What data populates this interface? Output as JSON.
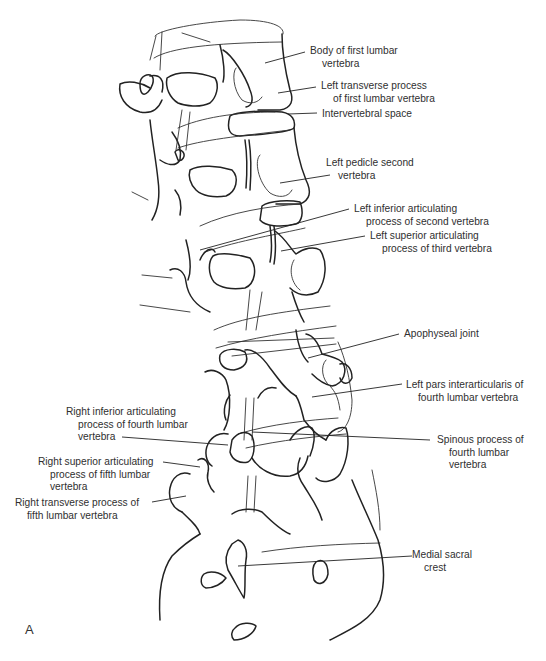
{
  "figure": {
    "panel_letter": "A",
    "labels": [
      {
        "id": "body-l1",
        "lines": [
          "Body of first lumbar",
          "vertebra"
        ],
        "x": 310,
        "y": 50,
        "indent": [
          0,
          12
        ]
      },
      {
        "id": "left-transverse-l1",
        "lines": [
          "Left transverse process",
          "of first lumbar vertebra"
        ],
        "x": 321,
        "y": 85,
        "indent": [
          0,
          12
        ]
      },
      {
        "id": "intervertebral-space",
        "lines": [
          "Intervertebral space"
        ],
        "x": 322,
        "y": 109,
        "indent": [
          0
        ]
      },
      {
        "id": "left-pedicle-second",
        "lines": [
          "Left pedicle second",
          "vertebra"
        ],
        "x": 326,
        "y": 157,
        "indent": [
          0,
          12
        ]
      },
      {
        "id": "left-inferior-articulating-second",
        "lines": [
          "Left inferior articulating",
          "process of second vertebra"
        ],
        "x": 354,
        "y": 204,
        "indent": [
          0,
          12
        ]
      },
      {
        "id": "left-superior-articulating-third",
        "lines": [
          "Left superior articulating",
          "process of third vertebra"
        ],
        "x": 370,
        "y": 231,
        "indent": [
          0,
          12
        ]
      },
      {
        "id": "apophyseal-joint",
        "lines": [
          "Apophyseal joint"
        ],
        "x": 404,
        "y": 327,
        "indent": [
          0
        ]
      },
      {
        "id": "left-pars-l4",
        "lines": [
          "Left pars interarticularis of",
          "fourth lumbar vertebra"
        ],
        "x": 406,
        "y": 379,
        "indent": [
          0,
          12
        ]
      },
      {
        "id": "spinous-l4",
        "lines": [
          "Spinous process of",
          "fourth lumbar",
          "vertebra"
        ],
        "x": 437,
        "y": 434,
        "indent": [
          0,
          12,
          12
        ]
      },
      {
        "id": "medial-sacral-crest",
        "lines": [
          "Medial sacral",
          "crest"
        ],
        "x": 411,
        "y": 549,
        "indent": [
          0,
          12
        ]
      },
      {
        "id": "right-inferior-articulating-l4",
        "lines": [
          "Right inferior articulating",
          "process of fourth lumbar",
          "vertebra"
        ],
        "x": 66,
        "y": 406,
        "indent": [
          0,
          12,
          12
        ]
      },
      {
        "id": "right-superior-articulating-l5",
        "lines": [
          "Right superior articulating",
          "process of fifth lumbar",
          "vertebra"
        ],
        "x": 38,
        "y": 456,
        "indent": [
          0,
          12,
          12
        ]
      },
      {
        "id": "right-transverse-l5",
        "lines": [
          "Right transverse process of",
          "fifth lumbar vertebra"
        ],
        "x": 15,
        "y": 497,
        "indent": [
          0,
          12
        ]
      }
    ],
    "leaders": [
      {
        "for": "body-l1",
        "x1": 305,
        "y1": 52,
        "x2": 265,
        "y2": 63
      },
      {
        "for": "left-transverse-l1",
        "x1": 316,
        "y1": 87,
        "x2": 278,
        "y2": 93
      },
      {
        "for": "intervertebral-space",
        "x1": 317,
        "y1": 113,
        "x2": 288,
        "y2": 114
      },
      {
        "for": "left-pedicle-second",
        "x1": 330,
        "y1": 175,
        "x2": 280,
        "y2": 183
      },
      {
        "for": "left-inferior-articulating-second",
        "x1": 349,
        "y1": 209,
        "x2": 200,
        "y2": 250
      },
      {
        "for": "left-superior-articulating-third",
        "x1": 365,
        "y1": 236,
        "x2": 281,
        "y2": 251
      },
      {
        "for": "apophyseal-joint",
        "x1": 399,
        "y1": 334,
        "x2": 308,
        "y2": 358
      },
      {
        "for": "left-pars-l4",
        "x1": 402,
        "y1": 384,
        "x2": 312,
        "y2": 397
      },
      {
        "for": "spinous-l4",
        "x1": 430,
        "y1": 440,
        "x2": 252,
        "y2": 432
      },
      {
        "for": "medial-sacral-crest",
        "x1": 412,
        "y1": 556,
        "x2": 238,
        "y2": 566
      },
      {
        "for": "right-inferior-articulating-l4",
        "x1": 122,
        "y1": 437,
        "x2": 228,
        "y2": 445
      },
      {
        "for": "right-superior-articulating-l5",
        "x1": 163,
        "y1": 462,
        "x2": 200,
        "y2": 467
      },
      {
        "for": "right-transverse-l5",
        "x1": 152,
        "y1": 502,
        "x2": 186,
        "y2": 496
      }
    ]
  }
}
